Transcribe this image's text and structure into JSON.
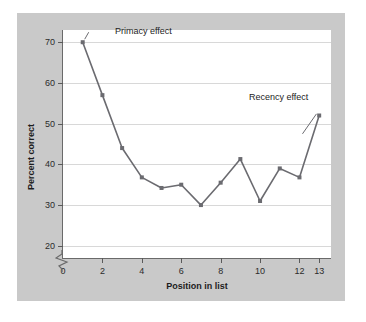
{
  "chart_data": {
    "type": "line",
    "title": "",
    "subtitle": "",
    "xlabel": "Position in list",
    "ylabel": "Percent correct",
    "x": [
      1,
      2,
      3,
      4,
      5,
      6,
      7,
      8,
      9,
      10,
      11,
      12,
      13
    ],
    "values": [
      70,
      57,
      44,
      36.8,
      34.2,
      35,
      30,
      35.5,
      41.3,
      31,
      39,
      36.8,
      52
    ],
    "series": [
      {
        "name": "Percent correct",
        "values": [
          70,
          57,
          44,
          36.8,
          34.2,
          35,
          30,
          35.5,
          41.3,
          31,
          39,
          36.8,
          52
        ]
      }
    ],
    "xlim": [
      0,
      13.6
    ],
    "ylim": [
      17,
      73
    ],
    "xticks": [
      0,
      2,
      4,
      6,
      8,
      10,
      12,
      13
    ],
    "xtick_labels": [
      "0",
      "2",
      "4",
      "6",
      "8",
      "10",
      "12",
      "13"
    ],
    "yticks": [
      20,
      30,
      40,
      50,
      60,
      70
    ],
    "ytick_labels": [
      "20",
      "30",
      "40",
      "50",
      "60",
      "70"
    ],
    "grid": true,
    "grid_axis": "y",
    "legend": false,
    "legend_position": "none",
    "y_axis_break": true,
    "y_axis_break_below": 20,
    "markers": true,
    "marker_shape": "square",
    "annotations": [
      {
        "text": "Primacy effect",
        "target_x": 1,
        "target_y": 70
      },
      {
        "text": "Recency effect",
        "target_x": 12,
        "target_y": 47
      }
    ],
    "colors": {
      "line": "#6b6b70",
      "marker": "#6b6b70",
      "grid": "#d8d8d8",
      "axis": "#6a6a6a",
      "plot_background": "#ffffff",
      "figure_background": "#c9c9c9",
      "text": "#1c1c1c"
    }
  }
}
